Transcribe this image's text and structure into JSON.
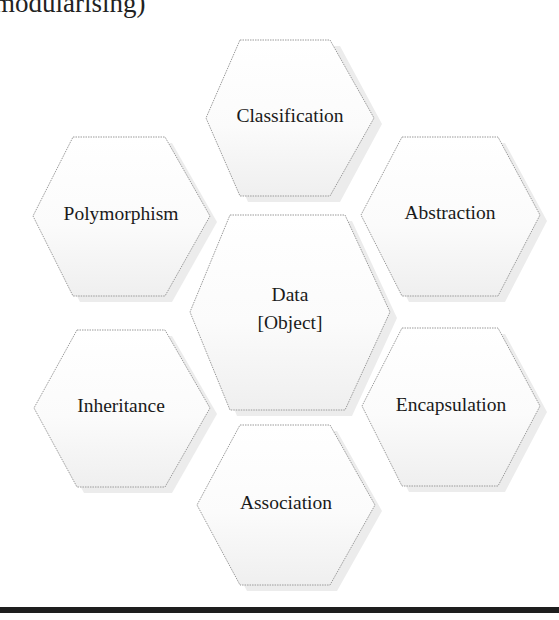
{
  "page": {
    "clipped_heading": "modularising)"
  },
  "diagram": {
    "type": "hexagon-cluster",
    "center": {
      "line1": "Data",
      "line2": "[Object]"
    },
    "hexagons": [
      {
        "id": "classification",
        "label": "Classification",
        "position": "top"
      },
      {
        "id": "polymorphism",
        "label": "Polymorphism",
        "position": "upper-left"
      },
      {
        "id": "abstraction",
        "label": "Abstraction",
        "position": "upper-right"
      },
      {
        "id": "inheritance",
        "label": "Inheritance",
        "position": "lower-left"
      },
      {
        "id": "encapsulation",
        "label": "Encapsulation",
        "position": "lower-right"
      },
      {
        "id": "association",
        "label": "Association",
        "position": "bottom"
      }
    ],
    "colors": {
      "hex_fill_top": "#ffffff",
      "hex_fill_bottom": "#f0f0f0",
      "hex_stroke": "#9a9a9a",
      "text": "#1a1a1a",
      "rule": "#1e1e1e"
    }
  }
}
